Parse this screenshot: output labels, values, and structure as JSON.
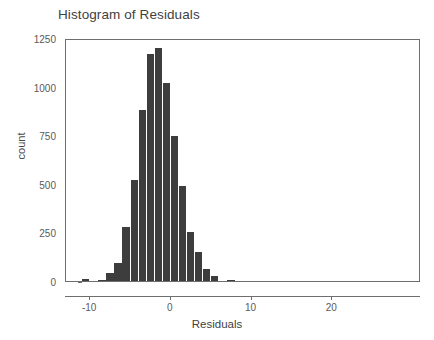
{
  "chart_data": {
    "type": "bar",
    "title": "Histogram of Residuals",
    "xlabel": "Residuals",
    "ylabel": "count",
    "xlim": [
      -13,
      31
    ],
    "ylim": [
      0,
      1250
    ],
    "grid": false,
    "legend": null,
    "bin_width": 1,
    "bar_color": "#3d3d3d",
    "x_ticks": [
      -10,
      0,
      10,
      20
    ],
    "x_tick_labels": [
      "-10",
      "0",
      "10",
      "20"
    ],
    "y_ticks": [
      0,
      250,
      500,
      750,
      1000,
      1250
    ],
    "y_tick_labels": [
      "0",
      "250",
      "500",
      "750",
      "1000",
      "1250"
    ],
    "bins": [
      {
        "x": -10.5,
        "value": 8
      },
      {
        "x": -8.5,
        "value": 4
      },
      {
        "x": -7.5,
        "value": 40
      },
      {
        "x": -6.5,
        "value": 92
      },
      {
        "x": -5.5,
        "value": 278
      },
      {
        "x": -4.5,
        "value": 520
      },
      {
        "x": -3.5,
        "value": 880
      },
      {
        "x": -2.5,
        "value": 1170
      },
      {
        "x": -1.5,
        "value": 1200
      },
      {
        "x": -0.5,
        "value": 1020
      },
      {
        "x": 0.5,
        "value": 745
      },
      {
        "x": 1.5,
        "value": 490
      },
      {
        "x": 2.5,
        "value": 250
      },
      {
        "x": 3.5,
        "value": 150
      },
      {
        "x": 4.5,
        "value": 60
      },
      {
        "x": 5.5,
        "value": 25
      },
      {
        "x": 7.5,
        "value": 6
      }
    ],
    "categories": [
      "-10.5",
      "-8.5",
      "-7.5",
      "-6.5",
      "-5.5",
      "-4.5",
      "-3.5",
      "-2.5",
      "-1.5",
      "-0.5",
      "0.5",
      "1.5",
      "2.5",
      "3.5",
      "4.5",
      "5.5",
      "7.5"
    ],
    "values": [
      8,
      4,
      40,
      92,
      278,
      520,
      880,
      1170,
      1200,
      1020,
      745,
      490,
      250,
      150,
      60,
      25,
      6
    ]
  }
}
